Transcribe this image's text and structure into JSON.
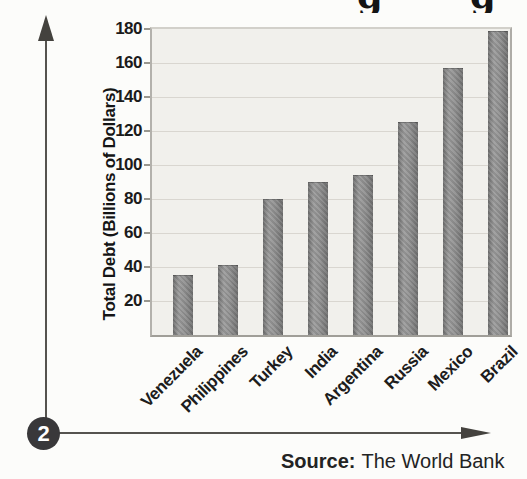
{
  "figure": {
    "number": "2",
    "cropped_title_fragments": [
      "g",
      "g"
    ]
  },
  "source": {
    "label": "Source:",
    "text": "The World Bank"
  },
  "chart_data": {
    "type": "bar",
    "title": "",
    "categories": [
      "Venezuela",
      "Philippines",
      "Turkey",
      "India",
      "Argentina",
      "Russia",
      "Mexico",
      "Brazil"
    ],
    "values": [
      35,
      41,
      80,
      90,
      94,
      125,
      157,
      179
    ],
    "xlabel": "",
    "ylabel": "Total Debt (Billions of Dollars)",
    "ylim": [
      0,
      180
    ],
    "yticks": [
      20,
      40,
      60,
      80,
      100,
      120,
      140,
      160,
      180
    ],
    "grid": true,
    "legend": false,
    "bar_color": "#8b8b8b",
    "plot_background": "#f1f0ec",
    "gridline_color": "#d9d6d0"
  }
}
